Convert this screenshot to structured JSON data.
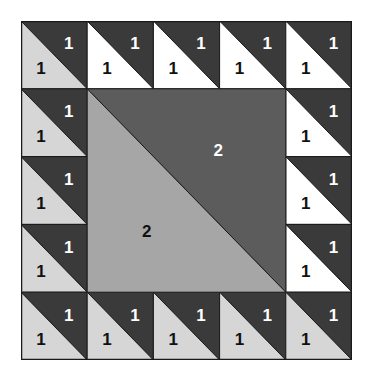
{
  "colors": {
    "dark": "#3a3a3a",
    "white": "#ffffff",
    "light": "#d6d6d6",
    "center_dark": "#5c5c5c",
    "center_light": "#a6a6a6",
    "line": "#1a1a1a",
    "label_on_dark": "#ffffff",
    "label_on_light": "#111111"
  },
  "grid": {
    "cols": 5,
    "rows": 5
  },
  "border_cells": [
    {
      "row": 0,
      "col": 0,
      "lower": "light",
      "upper_label": "1",
      "lower_label": "1"
    },
    {
      "row": 0,
      "col": 1,
      "lower": "white",
      "upper_label": "1",
      "lower_label": "1"
    },
    {
      "row": 0,
      "col": 2,
      "lower": "white",
      "upper_label": "1",
      "lower_label": "1"
    },
    {
      "row": 0,
      "col": 3,
      "lower": "white",
      "upper_label": "1",
      "lower_label": "1"
    },
    {
      "row": 0,
      "col": 4,
      "lower": "white",
      "upper_label": "1",
      "lower_label": "1"
    },
    {
      "row": 1,
      "col": 0,
      "lower": "light",
      "upper_label": "1",
      "lower_label": "1"
    },
    {
      "row": 1,
      "col": 4,
      "lower": "white",
      "upper_label": "1",
      "lower_label": "1"
    },
    {
      "row": 2,
      "col": 0,
      "lower": "light",
      "upper_label": "1",
      "lower_label": "1"
    },
    {
      "row": 2,
      "col": 4,
      "lower": "white",
      "upper_label": "1",
      "lower_label": "1"
    },
    {
      "row": 3,
      "col": 0,
      "lower": "light",
      "upper_label": "1",
      "lower_label": "1"
    },
    {
      "row": 3,
      "col": 4,
      "lower": "white",
      "upper_label": "1",
      "lower_label": "1"
    },
    {
      "row": 4,
      "col": 0,
      "lower": "light",
      "upper_label": "1",
      "lower_label": "1"
    },
    {
      "row": 4,
      "col": 1,
      "lower": "light",
      "upper_label": "1",
      "lower_label": "1"
    },
    {
      "row": 4,
      "col": 2,
      "lower": "light",
      "upper_label": "1",
      "lower_label": "1"
    },
    {
      "row": 4,
      "col": 3,
      "lower": "light",
      "upper_label": "1",
      "lower_label": "1"
    },
    {
      "row": 4,
      "col": 4,
      "lower": "light",
      "upper_label": "1",
      "lower_label": "1"
    }
  ],
  "center_block": {
    "upper_label": "2",
    "lower_label": "2"
  }
}
